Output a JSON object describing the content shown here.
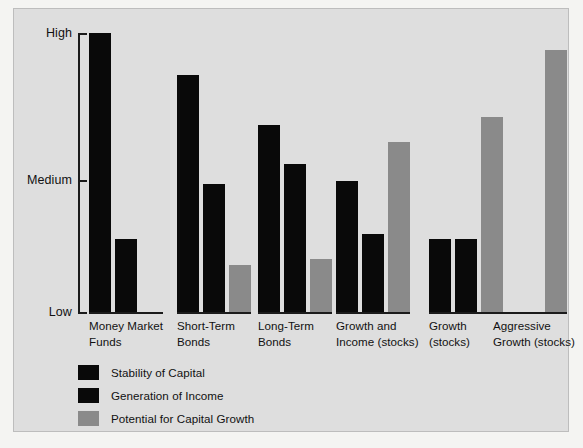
{
  "chart_data": {
    "type": "bar",
    "title": "",
    "subtitle": "",
    "xlabel": "",
    "ylabel": "",
    "grid": false,
    "legend_position": "bottom-left",
    "ytick_labels": [
      "Low",
      "Medium",
      "High"
    ],
    "ylim": [
      0,
      100
    ],
    "ytick_values": [
      0,
      50,
      100
    ],
    "categories": [
      "Money Market\nFunds",
      "Short-Term\nBonds",
      "Long-Term\nBonds",
      "Growth and\nIncome (stocks)",
      "Growth\n(stocks)",
      "Aggressive\nGrowth (stocks)"
    ],
    "series": [
      {
        "name": "Stability of Capital",
        "color": "#090909",
        "values": [
          100,
          85,
          67,
          47,
          26,
          0
        ]
      },
      {
        "name": "Generation of Income",
        "color": "#090909",
        "values": [
          26,
          46,
          53,
          28,
          26,
          0
        ]
      },
      {
        "name": "Potential for Capital Growth",
        "color": "#8a8a8a",
        "values": [
          0,
          17,
          19,
          61,
          70,
          94
        ]
      }
    ]
  },
  "axis": {
    "high_label": "High",
    "medium_label": "Medium",
    "low_label": "Low"
  },
  "categories": [
    {
      "line1": "Money Market",
      "line2": "Funds"
    },
    {
      "line1": "Short-Term",
      "line2": "Bonds"
    },
    {
      "line1": "Long-Term",
      "line2": "Bonds"
    },
    {
      "line1": "Growth and",
      "line2": "Income (stocks)"
    },
    {
      "line1": "Growth",
      "line2": "(stocks)"
    },
    {
      "line1": "Aggressive",
      "line2": "Growth (stocks)"
    }
  ],
  "legend": {
    "items": [
      {
        "label": "Stability of Capital",
        "color": "#090909"
      },
      {
        "label": "Generation of Income",
        "color": "#090909"
      },
      {
        "label": "Potential for Capital Growth",
        "color": "#8a8a8a"
      }
    ]
  },
  "colors": {
    "background": "#dedede",
    "page": "#f4f4f2",
    "ink": "#111111",
    "bar_dark": "#090909",
    "bar_gray": "#8a8a8a"
  }
}
